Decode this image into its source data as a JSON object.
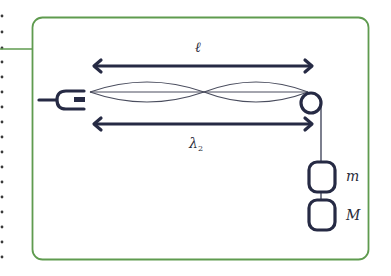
{
  "diagram": {
    "colors": {
      "frame": "#5f9b4f",
      "ink": "#262a44",
      "string": "#4a4d5e",
      "dots": "#3a3a3a"
    },
    "labels": {
      "length": "ℓ",
      "wavelength": "λ",
      "wavelength_subscript": "2",
      "mass_small": "m",
      "mass_large": "M"
    },
    "components": {
      "vibrator": "tuning-fork-vibrator",
      "string_loops": 2,
      "pulley": "pulley",
      "masses": [
        "m",
        "M"
      ]
    },
    "margin_dots": 17
  }
}
